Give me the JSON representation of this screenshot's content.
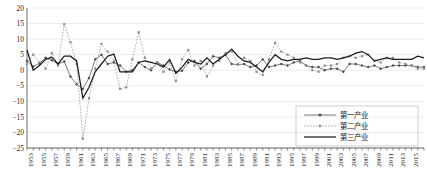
{
  "chart_data": {
    "type": "line",
    "title": "",
    "xlabel": "",
    "ylabel": "",
    "ylim": [
      -25,
      20
    ],
    "xlim": [
      1952,
      2016
    ],
    "ytick_step": 5,
    "yticks": [
      20,
      15,
      10,
      5,
      0,
      -5,
      -10,
      -15,
      -20,
      -25
    ],
    "grid": true,
    "legend_position": "bottom-right",
    "xticks": [
      1953,
      1955,
      1957,
      1959,
      1961,
      1963,
      1965,
      1967,
      1969,
      1971,
      1973,
      1975,
      1977,
      1979,
      1981,
      1983,
      1985,
      1987,
      1989,
      1991,
      1993,
      1995,
      1997,
      1999,
      2001,
      2003,
      2005,
      2007,
      2009,
      2011,
      2013,
      2015
    ],
    "x": [
      1952,
      1953,
      1954,
      1955,
      1956,
      1957,
      1958,
      1959,
      1960,
      1961,
      1962,
      1963,
      1964,
      1965,
      1966,
      1967,
      1968,
      1969,
      1970,
      1971,
      1972,
      1973,
      1974,
      1975,
      1976,
      1977,
      1978,
      1979,
      1980,
      1981,
      1982,
      1983,
      1984,
      1985,
      1986,
      1987,
      1988,
      1989,
      1990,
      1991,
      1992,
      1993,
      1994,
      1995,
      1996,
      1997,
      1998,
      1999,
      2000,
      2001,
      2002,
      2003,
      2004,
      2005,
      2006,
      2007,
      2008,
      2009,
      2010,
      2011,
      2012,
      2013,
      2014,
      2015,
      2016
    ],
    "series": [
      {
        "name": "第一产业",
        "style": "solid-with-diamond-markers",
        "color": "#5c5c5c",
        "values": [
          3.0,
          1.2,
          2.2,
          4.0,
          3.2,
          2.0,
          2.8,
          -2.0,
          -4.5,
          -6.0,
          -2.5,
          3.5,
          5.0,
          2.0,
          2.5,
          1.5,
          -0.5,
          0.0,
          2.5,
          1.0,
          0.0,
          2.5,
          1.5,
          0.2,
          -0.5,
          -0.2,
          2.5,
          3.0,
          0.5,
          2.0,
          4.5,
          4.0,
          5.0,
          2.0,
          1.8,
          2.0,
          1.0,
          1.5,
          3.5,
          1.0,
          1.5,
          2.0,
          1.5,
          2.5,
          3.0,
          1.5,
          1.0,
          1.0,
          0.0,
          0.5,
          0.5,
          -0.5,
          2.0,
          2.0,
          1.5,
          1.0,
          1.5,
          0.5,
          1.0,
          1.5,
          1.5,
          1.5,
          1.5,
          1.0,
          1.0
        ]
      },
      {
        "name": "第二产业",
        "style": "dotted-with-markers",
        "color": "#9a9a9a",
        "values": [
          2.0,
          5.0,
          2.5,
          0.5,
          5.5,
          1.5,
          14.8,
          9.0,
          2.0,
          -22.0,
          -9.0,
          0.5,
          8.5,
          6.0,
          3.0,
          -6.0,
          -5.5,
          3.5,
          12.2,
          4.0,
          0.5,
          2.5,
          -0.5,
          2.5,
          -3.5,
          3.5,
          6.5,
          1.5,
          3.0,
          -2.0,
          1.5,
          3.0,
          5.5,
          6.0,
          2.0,
          4.0,
          3.0,
          -0.5,
          -1.5,
          3.5,
          8.8,
          6.0,
          5.0,
          4.0,
          2.5,
          1.5,
          0.0,
          -0.5,
          1.5,
          1.5,
          2.0,
          4.0,
          4.5,
          4.0,
          4.5,
          5.0,
          3.0,
          2.5,
          4.0,
          4.0,
          2.5,
          2.0,
          1.5,
          0.5,
          0.5
        ]
      },
      {
        "name": "第三产业",
        "style": "solid-thick",
        "color": "#1c1c1c",
        "values": [
          6.5,
          0.0,
          1.5,
          3.5,
          4.2,
          2.0,
          4.5,
          4.5,
          3.0,
          -9.0,
          -5.5,
          -0.5,
          2.0,
          4.5,
          5.2,
          -0.5,
          -0.5,
          -0.5,
          2.5,
          3.0,
          2.5,
          2.0,
          1.0,
          3.5,
          -1.0,
          1.0,
          3.5,
          2.5,
          2.0,
          4.0,
          2.0,
          3.5,
          5.0,
          6.8,
          4.5,
          3.0,
          2.5,
          1.0,
          -0.5,
          2.5,
          5.0,
          3.5,
          3.0,
          3.5,
          3.5,
          4.0,
          3.5,
          3.5,
          4.0,
          4.0,
          3.5,
          4.0,
          4.5,
          5.5,
          6.0,
          5.0,
          3.0,
          3.5,
          4.0,
          3.5,
          3.5,
          3.5,
          3.5,
          4.5,
          4.0
        ]
      }
    ]
  },
  "legend": {
    "items": [
      {
        "label": "第一产业"
      },
      {
        "label": "第二产业"
      },
      {
        "label": "第三产业"
      }
    ]
  }
}
